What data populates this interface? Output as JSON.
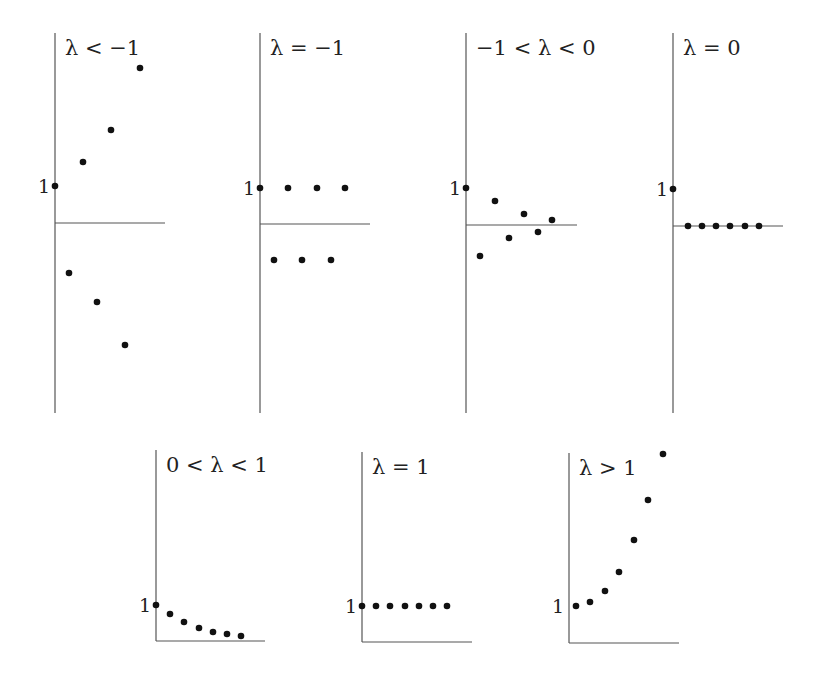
{
  "figure": {
    "point_color": "#111111",
    "axis_color": "#555555"
  },
  "chart_data": [
    {
      "type": "scatter",
      "title": "λ < −1",
      "ytick_label": "1",
      "frame": {
        "axis_x": 55,
        "axis_top": 33,
        "axis_bottom": 413,
        "baseline_y": 223,
        "x_axis_end": 165
      },
      "one_y": 186,
      "points": [
        [
          55,
          186
        ],
        [
          69,
          273
        ],
        [
          83,
          162
        ],
        [
          97,
          302
        ],
        [
          111,
          130
        ],
        [
          125,
          345
        ],
        [
          140,
          68
        ]
      ],
      "sequence": [
        1,
        -1.5,
        2.25,
        -3.4,
        5.1,
        -7.6,
        11.4
      ]
    },
    {
      "type": "scatter",
      "title": "λ = −1",
      "ytick_label": "1",
      "frame": {
        "axis_x": 260,
        "axis_top": 33,
        "axis_bottom": 413,
        "baseline_y": 224,
        "x_axis_end": 370
      },
      "one_y": 188,
      "points": [
        [
          260,
          188
        ],
        [
          274,
          260
        ],
        [
          288,
          188
        ],
        [
          302,
          260
        ],
        [
          317,
          188
        ],
        [
          331,
          260
        ],
        [
          345,
          188
        ]
      ],
      "sequence": [
        1,
        -1,
        1,
        -1,
        1,
        -1,
        1
      ]
    },
    {
      "type": "scatter",
      "title": "−1 < λ < 0",
      "ytick_label": "1",
      "frame": {
        "axis_x": 466,
        "axis_top": 33,
        "axis_bottom": 413,
        "baseline_y": 225,
        "x_axis_end": 577
      },
      "one_y": 188,
      "points": [
        [
          466,
          188
        ],
        [
          480,
          256
        ],
        [
          495,
          201
        ],
        [
          509,
          238
        ],
        [
          524,
          214
        ],
        [
          538,
          232
        ],
        [
          552,
          220
        ]
      ],
      "sequence": [
        1,
        -0.85,
        0.65,
        -0.35,
        0.3,
        -0.2,
        0.13
      ]
    },
    {
      "type": "scatter",
      "title": "λ = 0",
      "ytick_label": "1",
      "frame": {
        "axis_x": 673,
        "axis_top": 33,
        "axis_bottom": 413,
        "baseline_y": 226,
        "x_axis_end": 783
      },
      "one_y": 189,
      "points": [
        [
          673,
          189
        ],
        [
          688,
          226
        ],
        [
          702,
          226
        ],
        [
          716,
          226
        ],
        [
          730,
          226
        ],
        [
          745,
          226
        ],
        [
          759,
          226
        ]
      ],
      "sequence": [
        1,
        0,
        0,
        0,
        0,
        0,
        0
      ]
    },
    {
      "type": "scatter",
      "title": "0 < λ < 1",
      "ytick_label": "1",
      "frame": {
        "axis_x": 156,
        "axis_top": 450,
        "axis_bottom": 641,
        "baseline_y": 641,
        "x_axis_end": 265
      },
      "one_y": 605,
      "points": [
        [
          156,
          605
        ],
        [
          170,
          614
        ],
        [
          184,
          622
        ],
        [
          199,
          628
        ],
        [
          213,
          632
        ],
        [
          227,
          634
        ],
        [
          241,
          636
        ]
      ],
      "sequence": [
        1,
        0.75,
        0.53,
        0.36,
        0.25,
        0.19,
        0.14
      ]
    },
    {
      "type": "scatter",
      "title": "λ = 1",
      "ytick_label": "1",
      "frame": {
        "axis_x": 362,
        "axis_top": 452,
        "axis_bottom": 642,
        "baseline_y": 642,
        "x_axis_end": 472
      },
      "one_y": 606,
      "points": [
        [
          362,
          606
        ],
        [
          376,
          606
        ],
        [
          390,
          606
        ],
        [
          405,
          606
        ],
        [
          419,
          606
        ],
        [
          433,
          606
        ],
        [
          447,
          606
        ]
      ],
      "sequence": [
        1,
        1,
        1,
        1,
        1,
        1,
        1
      ]
    },
    {
      "type": "scatter",
      "title": "λ > 1",
      "ytick_label": "1",
      "frame": {
        "axis_x": 569,
        "axis_top": 453,
        "axis_bottom": 643,
        "baseline_y": 643,
        "x_axis_end": 679
      },
      "one_y": 606,
      "points": [
        [
          576,
          606
        ],
        [
          590,
          602
        ],
        [
          605,
          591
        ],
        [
          619,
          572
        ],
        [
          634,
          540
        ],
        [
          648,
          500
        ],
        [
          663,
          454
        ]
      ],
      "sequence": [
        1,
        1.1,
        1.4,
        1.9,
        2.8,
        3.9,
        5.2
      ]
    }
  ]
}
